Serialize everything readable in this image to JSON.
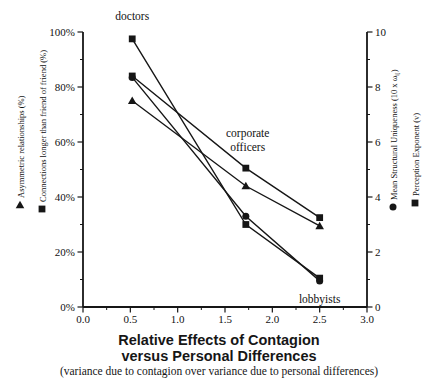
{
  "chart_data": {
    "type": "line",
    "title": "Relative Effects of Contagion",
    "title_line2": "versus Personal Differences",
    "subtitle": "(variance due to contagion over variance due to personal differences)",
    "ink_color": "#161616",
    "background": "#ffffff",
    "x": [
      0.52,
      1.72,
      2.5
    ],
    "x_axis": {
      "range": [
        0,
        3
      ],
      "tick_labels": [
        "0.0",
        "0.5",
        "1.0",
        "1.5",
        "2.0",
        "2.5",
        "3.0"
      ],
      "minor_tick_step": 0.25
    },
    "left_axis": {
      "range": [
        0,
        100
      ],
      "tick_labels": [
        "0%",
        "20%",
        "40%",
        "60%",
        "80%",
        "100%"
      ],
      "minor_tick_step": 10
    },
    "right_axis": {
      "range": [
        0,
        10
      ],
      "tick_labels": [
        "0",
        "2",
        "4",
        "6",
        "8",
        "10"
      ],
      "minor_tick_step": 1
    },
    "left_axis_legends": [
      {
        "marker": "triangle",
        "parts": [
          {
            "t": "Asymmetric relationships (%)"
          }
        ]
      },
      {
        "marker": "square",
        "parts": [
          {
            "t": "Connections longer than friend of friend (%)"
          }
        ]
      }
    ],
    "right_axis_legends": [
      {
        "marker": "circle",
        "parts": [
          {
            "t": "Mean Structural Uniqueness (10 x ω"
          },
          {
            "t": "ij",
            "sub": true
          },
          {
            "t": ")"
          }
        ]
      },
      {
        "marker": "square",
        "parts": [
          {
            "t": "Perception Exponent (v)"
          }
        ]
      }
    ],
    "series": [
      {
        "name": "Mean Structural Uniqueness (10 x ωij)",
        "marker": "circle",
        "axis": "right",
        "values": [
          8.35,
          3.3,
          0.95
        ]
      },
      {
        "name": "Connections longer than friend of friend (%)",
        "marker": "square",
        "axis": "left",
        "values": [
          84,
          50.5,
          32.5
        ]
      },
      {
        "name": "Perception Exponent (v)",
        "marker": "square",
        "axis": "right",
        "values": [
          9.75,
          3.0,
          1.05
        ]
      },
      {
        "name": "Asymmetric relationships (%)",
        "marker": "triangle",
        "axis": "left",
        "values": [
          75,
          44,
          29.5
        ]
      }
    ],
    "annotations": [
      {
        "lines": [
          "doctors"
        ],
        "x": 0.52,
        "y_pct": 104.5
      },
      {
        "lines": [
          "corporate",
          "officers"
        ],
        "x": 1.74,
        "y_pct": 61.8
      },
      {
        "lines": [
          "lobbyists"
        ],
        "x": 2.5,
        "y_pct": 1.5
      }
    ]
  }
}
